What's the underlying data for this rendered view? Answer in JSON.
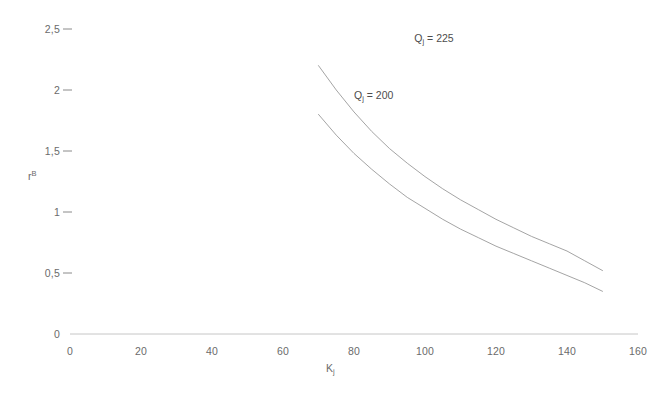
{
  "chart_data": {
    "type": "line",
    "title": "",
    "xlabel": "K",
    "xlabel_sub": "j",
    "ylabel": "r",
    "ylabel_sup": "B",
    "xlim": [
      0,
      160
    ],
    "ylim": [
      0,
      2.5
    ],
    "grid": false,
    "legend": "inline-curve-labels",
    "decimal_separator": ",",
    "xticks": [
      "0",
      "20",
      "40",
      "60",
      "80",
      "100",
      "120",
      "140",
      "160"
    ],
    "xtick_values": [
      0,
      20,
      40,
      60,
      80,
      100,
      120,
      140,
      160
    ],
    "yticks": [
      "0",
      "0,5",
      "1",
      "1,5",
      "2",
      "2,5"
    ],
    "ytick_values": [
      0,
      0.5,
      1,
      1.5,
      2,
      2.5
    ],
    "series": [
      {
        "name": "Q_j = 225",
        "label": "Q",
        "label_sub": "j",
        "label_eq": " = 225",
        "color": "#9a9a9a",
        "x": [
          70,
          75,
          80,
          85,
          90,
          95,
          100,
          105,
          110,
          115,
          120,
          125,
          130,
          135,
          140,
          145,
          150
        ],
        "y": [
          2.2,
          2.0,
          1.82,
          1.66,
          1.52,
          1.4,
          1.29,
          1.19,
          1.1,
          1.02,
          0.94,
          0.87,
          0.8,
          0.74,
          0.68,
          0.6,
          0.52
        ]
      },
      {
        "name": "Q_j = 200",
        "label": "Q",
        "label_sub": "j",
        "label_eq": " = 200",
        "color": "#9a9a9a",
        "x": [
          70,
          75,
          80,
          85,
          90,
          95,
          100,
          105,
          110,
          115,
          120,
          125,
          130,
          135,
          140,
          145,
          150
        ],
        "y": [
          1.8,
          1.63,
          1.48,
          1.35,
          1.23,
          1.12,
          1.03,
          0.94,
          0.86,
          0.79,
          0.72,
          0.66,
          0.6,
          0.54,
          0.48,
          0.42,
          0.35
        ]
      }
    ],
    "annotations": [
      {
        "text": "Q_j = 225",
        "x": 97,
        "y": 2.42
      },
      {
        "text": "Q_j = 200",
        "x": 80,
        "y": 1.95
      }
    ]
  },
  "axes": {
    "x_axis_color": "#bdbdbd",
    "tick_color": "#8a8a8a"
  }
}
